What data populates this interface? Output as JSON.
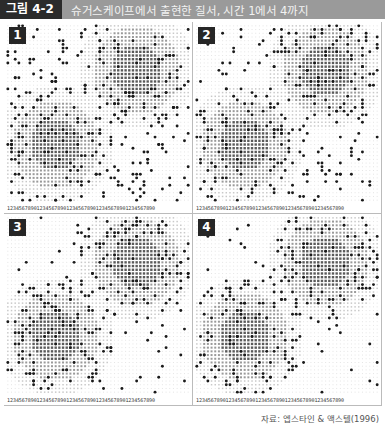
{
  "header": {
    "figure_label": "그림 4-2",
    "title": "슈거스케이프에서 출현한 질서, 시간 1에서 4까지"
  },
  "grid": {
    "cols": 50,
    "rows": 48,
    "cell_px": 3.66
  },
  "axis_digits": "12345678901234567890123456789012345678901234567890",
  "mountains": [
    {
      "cx": 35,
      "cy": 12,
      "inner_r": 7,
      "mid_r": 12,
      "outer_r": 16
    },
    {
      "cx": 13,
      "cy": 32,
      "inner_r": 7,
      "mid_r": 12,
      "outer_r": 16
    }
  ],
  "colors": {
    "inner": "#5a5a5a",
    "mid": "#9a9a9a",
    "outer": "#c9c9c9",
    "field": "#e4e4e4",
    "agent": "#1a1a1a"
  },
  "panels": [
    {
      "number": "1",
      "seed": 11,
      "agents": 330,
      "cluster": 0.15
    },
    {
      "number": "2",
      "seed": 23,
      "agents": 300,
      "cluster": 0.55
    },
    {
      "number": "3",
      "seed": 37,
      "agents": 280,
      "cluster": 0.75
    },
    {
      "number": "4",
      "seed": 41,
      "agents": 260,
      "cluster": 0.85
    }
  ],
  "caption": "자료: 엡스타인 & 액스텔(1996)"
}
